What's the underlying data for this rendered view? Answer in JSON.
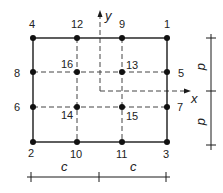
{
  "diagram": {
    "type": "grid-of-points",
    "colors": {
      "line": "#1a1a1a",
      "dashed": "#444444",
      "point": "#111111",
      "background": "#ffffff"
    },
    "axes": {
      "x_label": "x",
      "y_label": "y"
    },
    "dimensions": {
      "horizontal_label": "c",
      "vertical_label": "d"
    },
    "points": [
      {
        "id": "1",
        "label": "1"
      },
      {
        "id": "2",
        "label": "2"
      },
      {
        "id": "3",
        "label": "3"
      },
      {
        "id": "4",
        "label": "4"
      },
      {
        "id": "5",
        "label": "5"
      },
      {
        "id": "6",
        "label": "6"
      },
      {
        "id": "7",
        "label": "7"
      },
      {
        "id": "8",
        "label": "8"
      },
      {
        "id": "9",
        "label": "9"
      },
      {
        "id": "10",
        "label": "10"
      },
      {
        "id": "11",
        "label": "11"
      },
      {
        "id": "12",
        "label": "12"
      },
      {
        "id": "13",
        "label": "13"
      },
      {
        "id": "14",
        "label": "14"
      },
      {
        "id": "15",
        "label": "15"
      },
      {
        "id": "16",
        "label": "16"
      }
    ]
  }
}
